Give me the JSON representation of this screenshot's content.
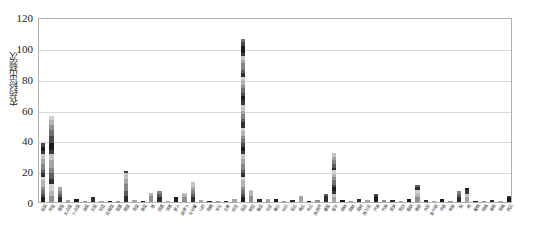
{
  "chart_data": {
    "type": "bar",
    "stacked": true,
    "title": "",
    "subtitle": "",
    "xlabel": "",
    "ylabel": "农药检出频次",
    "ylim": [
      0,
      120
    ],
    "ytick_values": [
      0,
      20,
      40,
      60,
      80,
      100,
      120
    ],
    "ytick_labels": [
      "0",
      "20",
      "40",
      "60",
      "80",
      "100",
      "120"
    ],
    "grid": true,
    "legend": "none",
    "orientation": "vertical",
    "categories": [
      "韭菜",
      "芹菜",
      "菠菜",
      "大白菜",
      "小白菜",
      "油菜",
      "生菜",
      "甘蓝",
      "花椰菜",
      "菜薹",
      "茼蒿",
      "苋菜",
      "香菜",
      "葱",
      "蒜薹",
      "洋葱",
      "萝卜",
      "胡萝卜",
      "马铃薯",
      "山药",
      "莲藕",
      "芋头",
      "生姜",
      "豇豆",
      "菜豆",
      "豌豆",
      "蚕豆",
      "毛豆",
      "黄瓜",
      "丝瓜",
      "苦瓜",
      "南瓜",
      "冬瓜",
      "西葫芦",
      "番茄",
      "茄子",
      "辣椒",
      "甜椒",
      "菜椒",
      "西兰花",
      "芦笋",
      "竹笋",
      "莴笋",
      "茭白",
      "蘑菇",
      "香菇",
      "木耳",
      "金针菇",
      "平菇",
      "苹果",
      "梨",
      "桃",
      "葡萄",
      "柑橘",
      "香蕉",
      "草莓",
      "西瓜"
    ],
    "values": [
      38,
      56,
      10,
      1,
      2,
      0.5,
      3,
      0.5,
      0.5,
      0.5,
      20,
      1,
      0.5,
      6,
      7,
      0.5,
      3,
      6,
      13,
      1,
      0.5,
      0.5,
      0.5,
      2,
      106,
      8,
      2,
      2,
      2,
      0.5,
      1,
      4,
      0.5,
      1,
      5,
      32,
      1,
      0.5,
      2,
      1,
      5,
      1,
      1,
      0.5,
      2,
      11,
      1,
      0.5,
      2,
      0.5,
      7,
      9,
      0.5,
      0.5,
      1,
      0.5,
      4
    ],
    "stack_segments": [
      [
        3,
        2,
        3,
        2,
        4,
        2,
        3,
        2,
        4,
        3,
        3,
        2,
        3,
        2
      ],
      [
        4,
        3,
        5,
        3,
        4,
        3,
        5,
        4,
        3,
        4,
        5,
        4,
        3,
        3,
        3
      ],
      [
        3,
        2,
        2,
        3,
        0
      ]
    ],
    "palette": [
      "#1c1c1c",
      "#4a4a4a",
      "#707070",
      "#909090",
      "#b4b4b4",
      "#d0d0d0",
      "#2e2e2e",
      "#5d5d5d",
      "#848484",
      "#a5a5a5",
      "#c3c3c3",
      "#3b3b3b"
    ],
    "axis_color": "#b0b0b0",
    "grid_color": "#d9d9d9",
    "background": "#ffffff"
  }
}
